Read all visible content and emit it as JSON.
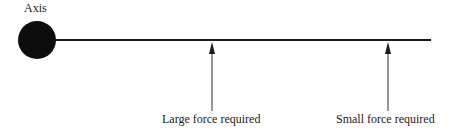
{
  "diagram": {
    "axis_label": "Axis",
    "labels": {
      "large": "Large force required",
      "small": "Small force required"
    },
    "colors": {
      "stroke": "#1a1a1a",
      "pivot": "#0d0d0d"
    }
  }
}
